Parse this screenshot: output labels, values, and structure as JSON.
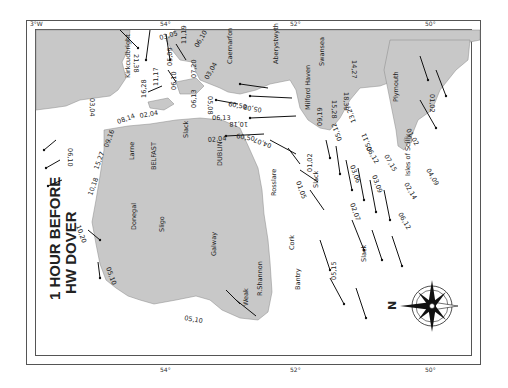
{
  "map": {
    "title_line1": "1 HOUR BEFORE",
    "title_line2": "HW DOVER",
    "orientation": "rotated 90° clockwise (north points left)",
    "compass": {
      "label": "N"
    },
    "colors": {
      "land": "#c8c8c8",
      "sea": "#ffffff",
      "frame": "#555555",
      "text": "#222222"
    },
    "graticule": {
      "top": [
        "3°W",
        "54°",
        "52°",
        "50°"
      ],
      "left": [
        "3°W",
        "1°",
        "5°",
        "7°"
      ],
      "right": [
        "3°W",
        "5°",
        "7°",
        "9°"
      ],
      "bottom": [
        "54°",
        "52°",
        "50°"
      ]
    },
    "places": [
      "Kirkcudbright",
      "Caernarfon",
      "Aberystwyth",
      "Swansea",
      "Milford Haven",
      "Plymouth",
      "Larne",
      "BELFAST",
      "DUBLIN",
      "Rosslare",
      "Donegal",
      "Sligo",
      "Galway",
      "R.Shannon",
      "Cork",
      "Bantry",
      "Isles of Scilly"
    ],
    "annotations": [
      "Slack",
      "Slack",
      "Slack",
      "Weak",
      "Weak",
      "Weak"
    ],
    "tidal_rates": [
      "21,38",
      "03,05",
      "11,19",
      "06,10",
      "05,09",
      "16,28",
      "11,17",
      "06,10",
      "07,20",
      "03,04",
      "08,14",
      "02,04",
      "03,04",
      "09,16",
      "06,13",
      "05,08",
      "60,50",
      "06,13",
      "10,18",
      "05,08",
      "02,04",
      "60,50",
      "01,02",
      "04,07",
      "06,10",
      "15,27",
      "10,18",
      "10,20",
      "05,10",
      "05,10",
      "15,28",
      "18,39",
      "14,27",
      "09,19",
      "13,27",
      "05,12",
      "05,11",
      "01,02",
      "01,02",
      "03,06",
      "06,12",
      "07,15",
      "03,09",
      "02,07",
      "01,05",
      "04,09",
      "02,14",
      "06,12",
      "05,15"
    ]
  }
}
